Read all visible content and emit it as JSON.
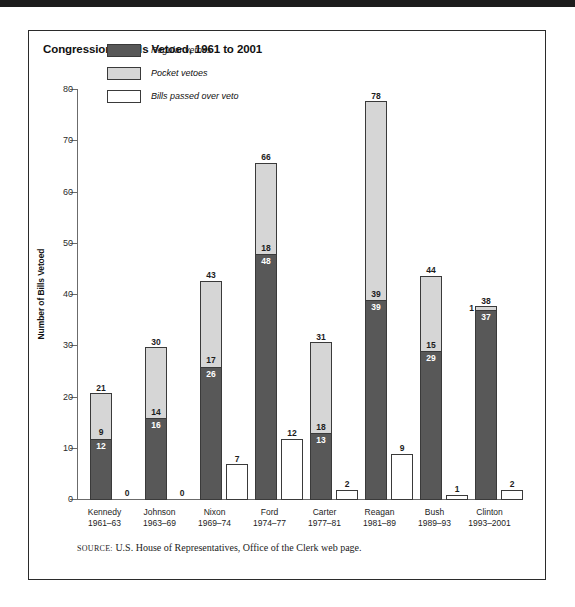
{
  "figure": {
    "title": "Congressional Bills Vetoed, 1961 to 2001",
    "source_keyword": "SOURCE:",
    "source_text": "U.S. House of Representatives, Office of the Clerk web page."
  },
  "legend": {
    "items": [
      {
        "label": "Regular vetoes",
        "color": "#585858"
      },
      {
        "label": "Pocket vetoes",
        "color": "#d6d6d6"
      },
      {
        "label": "Bills passed over veto",
        "color": "#ffffff"
      }
    ]
  },
  "axis": {
    "y_title": "Number of Bills Vetoed",
    "y_ticks": [
      "0",
      "10",
      "20",
      "30",
      "40",
      "50",
      "60",
      "70",
      "80"
    ]
  },
  "chart_data": {
    "type": "bar",
    "title": "Congressional Bills Vetoed, 1961 to 2001",
    "xlabel": "",
    "ylabel": "Number of Bills Vetoed",
    "ylim": [
      0,
      80
    ],
    "ytick_step": 10,
    "grid": false,
    "legend_position": "top-left-inside",
    "stacked": true,
    "categories": [
      "Kennedy",
      "Johnson",
      "Nixon",
      "Ford",
      "Carter",
      "Reagan",
      "Bush",
      "Clinton"
    ],
    "category_years": [
      "1961–63",
      "1963–69",
      "1969–74",
      "1974–77",
      "1977–81",
      "1981–89",
      "1989–93",
      "1993–2001"
    ],
    "series": [
      {
        "name": "Regular vetoes",
        "color": "#585858",
        "values": [
          12,
          16,
          26,
          48,
          13,
          39,
          29,
          37
        ]
      },
      {
        "name": "Pocket vetoes",
        "color": "#d6d6d6",
        "values": [
          9,
          14,
          17,
          18,
          18,
          39,
          15,
          1
        ]
      },
      {
        "name": "Bills passed over veto",
        "color": "#ffffff",
        "values": [
          0,
          0,
          7,
          12,
          2,
          9,
          1,
          2
        ]
      }
    ],
    "totals": [
      21,
      30,
      43,
      66,
      31,
      78,
      44,
      38
    ]
  },
  "scan_artifact": {
    "line1": "",
    "line2": ""
  }
}
